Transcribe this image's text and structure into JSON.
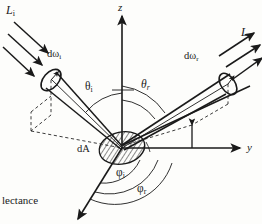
{
  "figure": {
    "kind": "brdf-geometry-diagram",
    "background_color": "#fdfdfb",
    "ink_color": "#1a1a1a",
    "axes": {
      "z_label": "z",
      "y_label": "y",
      "origin_patch_label": "dA"
    },
    "labels": {
      "incident_radiance": "L",
      "incident_radiance_sub": "i",
      "reflected_radiance": "L",
      "reflected_radiance_sub": "r",
      "incident_solid_angle": "dω",
      "incident_solid_angle_sub": "i",
      "reflected_solid_angle": "dω",
      "reflected_solid_angle_sub": "r",
      "theta_incident": "θ",
      "theta_incident_sub": "i",
      "theta_reflected": "θ",
      "theta_reflected_sub": "r",
      "phi_incident": "φ",
      "phi_incident_sub": "i",
      "phi_reflected": "φ",
      "phi_reflected_sub": "r"
    },
    "caption_fragment": "lectance"
  }
}
